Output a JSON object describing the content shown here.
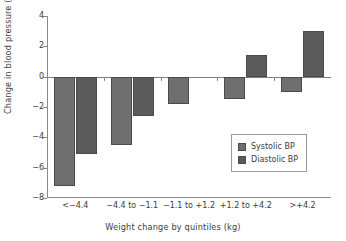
{
  "chart_data": {
    "type": "bar",
    "title": "",
    "xlabel": "Weight change by quintiles (kg)",
    "ylabel": "Change in blood pressure (mmHg)",
    "categories": [
      "<−4.4",
      "−4.4 to −1.1",
      "−1.1 to +1.2",
      "+1.2 to +4.2",
      ">+4.2"
    ],
    "series": [
      {
        "name": "Systolic BP",
        "color": "#6f6f6f",
        "values": [
          -7.2,
          -4.5,
          -1.8,
          -1.5,
          -1.0
        ]
      },
      {
        "name": "Diastolic BP",
        "color": "#5b5b5b",
        "values": [
          -5.1,
          -2.6,
          0.0,
          1.4,
          3.0
        ]
      }
    ],
    "ylim": [
      -8,
      4
    ],
    "yticks": [
      4,
      2,
      0,
      -2,
      -4,
      -6,
      -8
    ],
    "ytick_labels": [
      "4",
      "2",
      "0",
      "−2",
      "−4",
      "−6",
      "−8"
    ],
    "grid": false,
    "legend_position": "lower-right",
    "legend_entries": [
      "Systolic BP",
      "Diastolic BP"
    ]
  }
}
